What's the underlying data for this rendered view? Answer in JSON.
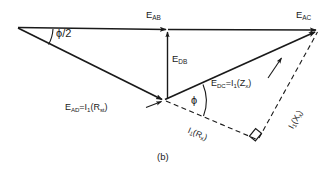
{
  "figure": {
    "caption": "(b)",
    "type": "phasor-diagram",
    "background_color": "#ffffff",
    "line_color": "#1a1a1a"
  },
  "labels": {
    "e_ab": {
      "base": "E",
      "sub": "AB"
    },
    "e_ac": {
      "base": "E",
      "sub": "AC"
    },
    "e_db": {
      "base": "E",
      "sub": "DB"
    },
    "e_dc": {
      "base": "E",
      "sub": "DC",
      "equals": "=I",
      "cur_sub": "1",
      "term": "(Z",
      "term_sub": "x",
      "close": ")"
    },
    "e_ad": {
      "base": "E",
      "sub": "AD",
      "equals": "=I",
      "cur_sub": "1",
      "term": "(R",
      "term_sub": "st",
      "close": ")"
    },
    "i1_rx": {
      "base": "I",
      "sub": "1",
      "term": "(R",
      "term_sub": "x",
      "close": ")"
    },
    "i1_xx": {
      "base": "I",
      "sub": "1",
      "term": "(X",
      "term_sub": "x",
      "close": ")"
    },
    "angle_phi_half": "ϕ/2",
    "angle_phi": "ϕ"
  },
  "geometry": {
    "point_a": [
      18,
      27
    ],
    "point_b": [
      168,
      30
    ],
    "point_c": [
      318,
      30
    ],
    "point_d": [
      164,
      100
    ],
    "point_corner": [
      258,
      140
    ]
  }
}
